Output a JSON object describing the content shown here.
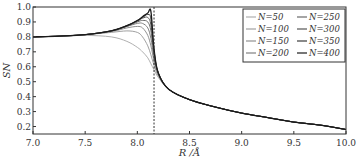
{
  "chart_data": {
    "type": "line",
    "title": "",
    "xlabel": "R /Å",
    "ylabel": "S_N",
    "xlim": [
      7.0,
      10.0
    ],
    "ylim": [
      0.15,
      1.0
    ],
    "xticks": [
      "7.0",
      "7.5",
      "8.0",
      "8.5",
      "9.0",
      "9.5",
      "10.0"
    ],
    "yticks": [
      "0.2",
      "0.3",
      "0.4",
      "0.5",
      "0.6",
      "0.7",
      "0.8",
      "0.9",
      "1.0"
    ],
    "grid": false,
    "legend_position": "upper right",
    "vline": {
      "x": 8.16,
      "style": "dashed"
    },
    "x": [
      7.0,
      7.25,
      7.5,
      7.75,
      7.9,
      8.0,
      8.05,
      8.1,
      8.13,
      8.16,
      8.2,
      8.3,
      8.5,
      8.75,
      9.0,
      9.25,
      9.5,
      9.75,
      10.0
    ],
    "series": [
      {
        "name": "N=50",
        "color": "#b0b0b0",
        "values": [
          0.8,
          0.805,
          0.81,
          0.8,
          0.77,
          0.73,
          0.7,
          0.66,
          0.62,
          0.58,
          0.53,
          0.45,
          0.38,
          0.33,
          0.29,
          0.26,
          0.23,
          0.21,
          0.18
        ]
      },
      {
        "name": "N=100",
        "color": "#a0a0a0",
        "values": [
          0.8,
          0.805,
          0.815,
          0.83,
          0.84,
          0.83,
          0.8,
          0.74,
          0.68,
          0.61,
          0.54,
          0.45,
          0.38,
          0.33,
          0.29,
          0.26,
          0.23,
          0.21,
          0.18
        ]
      },
      {
        "name": "N=150",
        "color": "#909090",
        "values": [
          0.8,
          0.805,
          0.815,
          0.835,
          0.86,
          0.87,
          0.86,
          0.81,
          0.74,
          0.64,
          0.55,
          0.45,
          0.38,
          0.33,
          0.29,
          0.26,
          0.23,
          0.21,
          0.18
        ]
      },
      {
        "name": "N=200",
        "color": "#808080",
        "values": [
          0.8,
          0.805,
          0.815,
          0.84,
          0.87,
          0.89,
          0.89,
          0.86,
          0.79,
          0.66,
          0.55,
          0.45,
          0.38,
          0.33,
          0.29,
          0.26,
          0.23,
          0.21,
          0.18
        ]
      },
      {
        "name": "N=250",
        "color": "#6a6a6a",
        "values": [
          0.8,
          0.805,
          0.815,
          0.84,
          0.87,
          0.9,
          0.91,
          0.9,
          0.84,
          0.68,
          0.56,
          0.45,
          0.38,
          0.33,
          0.29,
          0.26,
          0.23,
          0.21,
          0.18
        ]
      },
      {
        "name": "N=300",
        "color": "#555555",
        "values": [
          0.8,
          0.805,
          0.815,
          0.84,
          0.875,
          0.905,
          0.925,
          0.93,
          0.88,
          0.7,
          0.56,
          0.45,
          0.38,
          0.33,
          0.29,
          0.26,
          0.23,
          0.21,
          0.18
        ]
      },
      {
        "name": "N=350",
        "color": "#3a3a3a",
        "values": [
          0.8,
          0.805,
          0.815,
          0.84,
          0.875,
          0.91,
          0.93,
          0.95,
          0.92,
          0.71,
          0.56,
          0.45,
          0.38,
          0.33,
          0.29,
          0.26,
          0.23,
          0.21,
          0.18
        ]
      },
      {
        "name": "N=400",
        "color": "#1a1a1a",
        "values": [
          0.8,
          0.805,
          0.815,
          0.84,
          0.875,
          0.91,
          0.935,
          0.96,
          0.97,
          0.72,
          0.56,
          0.45,
          0.38,
          0.33,
          0.29,
          0.26,
          0.23,
          0.21,
          0.18
        ]
      }
    ]
  },
  "legend": {
    "items": [
      "N=50",
      "N=250",
      "N=100",
      "N=300",
      "N=150",
      "N=350",
      "N=200",
      "N=400"
    ]
  }
}
